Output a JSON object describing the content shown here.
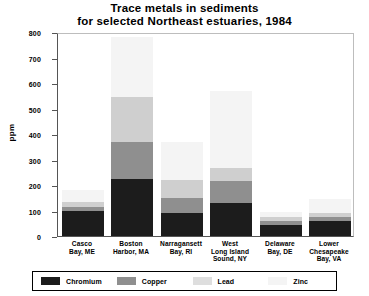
{
  "chart_data": {
    "type": "bar",
    "stacked": true,
    "title": "Trace metals in sediments for selected Northeast estuaries, 1984",
    "title_lines": [
      "Trace metals in sediments",
      "for selected Northeast estuaries, 1984"
    ],
    "xlabel": "",
    "ylabel": "ppm",
    "ylim": [
      0,
      800
    ],
    "yticks": [
      0,
      100,
      200,
      300,
      400,
      500,
      600,
      700,
      800
    ],
    "grid": false,
    "legend_position": "bottom",
    "categories": [
      "Casco Bay, ME",
      "Boston Harbor, MA",
      "Narragansett Bay, RI",
      "West Long Island Sound, NY",
      "Delaware Bay, DE",
      "Lower Chesapeake Bay, VA"
    ],
    "category_lines": [
      [
        "Casco",
        "Bay, ME"
      ],
      [
        "Boston",
        "Harbor, MA"
      ],
      [
        "Narragansett",
        "Bay, RI"
      ],
      [
        "West",
        "Long Island",
        "Sound, NY"
      ],
      [
        "Delaware",
        "Bay, DE"
      ],
      [
        "Lower",
        "Chesapeake",
        "Bay, VA"
      ]
    ],
    "series": [
      {
        "name": "Chromium",
        "color": "#1c1c1c",
        "values": [
          100,
          225,
          90,
          130,
          45,
          60
        ]
      },
      {
        "name": "Copper",
        "color": "#8f8f8f",
        "values": [
          15,
          145,
          60,
          85,
          15,
          15
        ]
      },
      {
        "name": "Lead",
        "color": "#cfcfcf",
        "values": [
          20,
          175,
          70,
          50,
          15,
          15
        ]
      },
      {
        "name": "Zinc",
        "color": "#f4f4f4",
        "values": [
          45,
          235,
          150,
          305,
          20,
          57
        ]
      }
    ],
    "totals": [
      180,
      780,
      370,
      570,
      95,
      147
    ]
  },
  "legend": {
    "items": [
      {
        "label": "Chromium",
        "swatch": "chromium"
      },
      {
        "label": "Copper",
        "swatch": "copper"
      },
      {
        "label": "Lead",
        "swatch": "lead"
      },
      {
        "label": "Zinc",
        "swatch": "zinc"
      }
    ]
  }
}
